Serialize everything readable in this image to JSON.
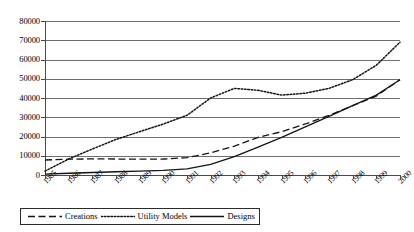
{
  "chart_data": {
    "type": "line",
    "title": "",
    "xlabel": "",
    "ylabel": "",
    "ylim": [
      0,
      80000
    ],
    "ytick_step": 10000,
    "grid": true,
    "legend_position": "bottom",
    "categories": [
      "1985",
      "1986",
      "1987",
      "1988",
      "1989",
      "1990",
      "1991",
      "1992",
      "1993",
      "1994",
      "1995",
      "1996",
      "1997",
      "1998",
      "1999",
      "2000"
    ],
    "yticks": [
      "0",
      "10000",
      "20000",
      "30000",
      "40000",
      "50000",
      "60000",
      "70000",
      "80000"
    ],
    "series": [
      {
        "name": "Creations",
        "style": "dashed",
        "values": [
          7800,
          8200,
          8400,
          8300,
          8200,
          8300,
          9000,
          11500,
          15000,
          19500,
          22500,
          26500,
          31000,
          36000,
          41000,
          49500
        ]
      },
      {
        "name": "Utility Models",
        "style": "dotted",
        "values": [
          2000,
          8300,
          13500,
          18500,
          22500,
          26500,
          31000,
          40000,
          45000,
          44000,
          41500,
          42500,
          45000,
          49500,
          57000,
          69000
        ]
      },
      {
        "name": "Designs",
        "style": "solid",
        "values": [
          500,
          900,
          1300,
          1700,
          2000,
          2400,
          3200,
          5500,
          9500,
          14500,
          19500,
          25000,
          30500,
          36000,
          41500,
          49500
        ]
      }
    ]
  },
  "legend": {
    "items": [
      {
        "label": "Creations",
        "style": "dashed"
      },
      {
        "label": "Utility Models",
        "style": "dotted"
      },
      {
        "label": "Designs",
        "style": "solid"
      }
    ]
  },
  "colors": {
    "axis": "#4a4a4a",
    "grid": "#6e6e6e",
    "line": "#151515",
    "background": "#ffffff"
  }
}
